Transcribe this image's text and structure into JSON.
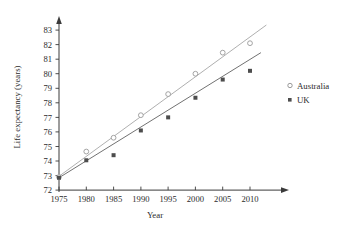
{
  "chart_data": {
    "type": "scatter",
    "title": "",
    "xlabel": "Year",
    "ylabel": "Life expectancy (years)",
    "x": [
      1975,
      1980,
      1985,
      1990,
      1995,
      2000,
      2005,
      2010
    ],
    "xticklabels": [
      "1975",
      "1980",
      "1985",
      "1990",
      "1995",
      "2000",
      "2005",
      "2010"
    ],
    "yticklabels": [
      "72",
      "73",
      "74",
      "75",
      "76",
      "77",
      "78",
      "79",
      "80",
      "81",
      "82",
      "83"
    ],
    "xlim": [
      1975,
      2013
    ],
    "ylim": [
      72,
      83.4
    ],
    "grid": false,
    "legend_position": "right",
    "series": [
      {
        "name": "Australia",
        "marker": "open-circle",
        "color": "#9a9a9a",
        "values": [
          72.9,
          74.65,
          75.6,
          77.15,
          78.6,
          80.0,
          81.45,
          82.1
        ],
        "trendline": {
          "x1": 1975,
          "y1": 72.95,
          "x2": 2013,
          "y2": 83.35
        }
      },
      {
        "name": "UK",
        "marker": "filled-square",
        "color": "#4d4d4d",
        "values": [
          72.85,
          74.05,
          74.4,
          76.1,
          77.0,
          78.35,
          79.6,
          80.2
        ],
        "trendline": {
          "x1": 1975,
          "y1": 72.85,
          "x2": 2012,
          "y2": 81.45
        }
      }
    ]
  },
  "axes": {
    "x_title": "Year",
    "y_title": "Life expectancy (years)"
  },
  "legend": {
    "items": [
      {
        "label": "Australia",
        "marker": "open-circle"
      },
      {
        "label": "UK",
        "marker": "filled-square"
      }
    ]
  },
  "ticks": {
    "y": [
      "83",
      "82",
      "81",
      "80",
      "79",
      "78",
      "77",
      "76",
      "75",
      "74",
      "73",
      "72"
    ],
    "x": [
      "1975",
      "1980",
      "1985",
      "1990",
      "1995",
      "2000",
      "2005",
      "2010"
    ]
  }
}
